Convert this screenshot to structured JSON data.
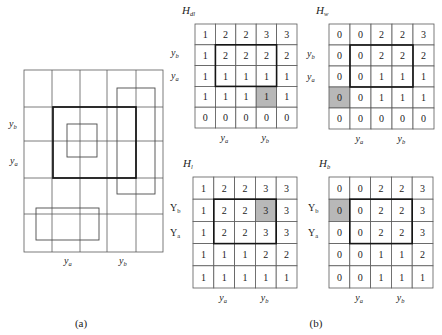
{
  "colors": {
    "highlight": "#b8b8b8",
    "grid": "#5a5a5a",
    "bold": "#151515",
    "text": "#222222"
  },
  "panel_a": {
    "caption": "(a)",
    "grid_rows": 5,
    "grid_cols": 5,
    "row_labels": [
      {
        "base": "y",
        "sub": "b"
      },
      {
        "base": "y",
        "sub": "a"
      }
    ],
    "col_labels": [
      {
        "base": "y",
        "sub": "a"
      },
      {
        "base": "y",
        "sub": "b"
      }
    ]
  },
  "panel_b": {
    "caption": "(b)",
    "matrices": [
      {
        "id": "H_dl",
        "title": {
          "base": "H",
          "sub": "dl"
        },
        "values": [
          [
            1,
            2,
            2,
            3,
            3
          ],
          [
            1,
            2,
            2,
            2,
            2
          ],
          [
            1,
            1,
            1,
            1,
            1
          ],
          [
            1,
            1,
            1,
            1,
            1
          ],
          [
            0,
            0,
            0,
            0,
            0
          ]
        ],
        "highlight_cell": [
          3,
          3
        ],
        "bold_region": {
          "rows": [
            1,
            2
          ],
          "cols": [
            1,
            3
          ]
        },
        "row_labels": [
          {
            "base": "y",
            "sub": "b"
          },
          {
            "base": "y",
            "sub": "a"
          }
        ],
        "col_labels": [
          {
            "base": "y",
            "sub": "a"
          },
          {
            "base": "y",
            "sub": "b"
          }
        ]
      },
      {
        "id": "H_w",
        "title": {
          "base": "H",
          "sub": "w"
        },
        "values": [
          [
            0,
            0,
            2,
            2,
            3
          ],
          [
            0,
            0,
            2,
            2,
            2
          ],
          [
            0,
            0,
            1,
            1,
            1
          ],
          [
            0,
            0,
            1,
            1,
            1
          ],
          [
            0,
            0,
            0,
            0,
            0
          ]
        ],
        "highlight_cell": [
          3,
          0
        ],
        "bold_region": {
          "rows": [
            1,
            2
          ],
          "cols": [
            1,
            3
          ]
        },
        "row_labels": [
          {
            "base": "y",
            "sub": "b"
          },
          {
            "base": "y",
            "sub": "a"
          }
        ],
        "col_labels": [
          {
            "base": "y",
            "sub": "a"
          },
          {
            "base": "y",
            "sub": "b"
          }
        ]
      },
      {
        "id": "H_l",
        "title": {
          "base": "H",
          "sub": "l"
        },
        "values": [
          [
            1,
            2,
            2,
            3,
            3
          ],
          [
            1,
            2,
            2,
            3,
            3
          ],
          [
            1,
            2,
            2,
            3,
            3
          ],
          [
            1,
            1,
            1,
            2,
            2
          ],
          [
            1,
            1,
            1,
            1,
            1
          ]
        ],
        "highlight_cell": [
          1,
          3
        ],
        "bold_region": {
          "rows": [
            1,
            2
          ],
          "cols": [
            1,
            3
          ]
        },
        "row_labels": [
          {
            "base": "Y",
            "sub": "b"
          },
          {
            "base": "Y",
            "sub": "a"
          }
        ],
        "col_labels": [
          {
            "base": "y",
            "sub": "a"
          },
          {
            "base": "y",
            "sub": "b"
          }
        ]
      },
      {
        "id": "H_b",
        "title": {
          "base": "H",
          "sub": "b"
        },
        "values": [
          [
            0,
            0,
            2,
            2,
            3
          ],
          [
            0,
            0,
            2,
            2,
            3
          ],
          [
            0,
            0,
            2,
            2,
            3
          ],
          [
            0,
            0,
            1,
            1,
            2
          ],
          [
            0,
            0,
            1,
            1,
            1
          ]
        ],
        "highlight_cell": [
          1,
          0
        ],
        "bold_region": {
          "rows": [
            1,
            2
          ],
          "cols": [
            1,
            3
          ]
        },
        "row_labels": [
          {
            "base": "Y",
            "sub": "b"
          },
          {
            "base": "Y",
            "sub": "a"
          }
        ],
        "col_labels": [
          {
            "base": "y",
            "sub": "a"
          },
          {
            "base": "y",
            "sub": "b"
          }
        ]
      }
    ]
  }
}
